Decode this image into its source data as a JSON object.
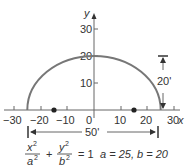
{
  "diagram": {
    "type": "semi-ellipse",
    "colors": {
      "curve": "#777777",
      "axis": "#666666",
      "text": "#333333",
      "focus": "#222222",
      "background": "#ffffff"
    },
    "axes": {
      "x_label": "x",
      "y_label": "y",
      "x_ticks": [
        "−30",
        "−20",
        "−10",
        "0",
        "10",
        "20",
        "30"
      ],
      "y_ticks": [
        "10",
        "20",
        "30"
      ]
    },
    "dimensions": {
      "width_label": "50'",
      "height_label": "20'"
    },
    "equation": {
      "x_num": "x",
      "x_den": "a",
      "y_num": "y",
      "y_den": "b",
      "exp": "2",
      "plus": "+",
      "equals": "= 1",
      "params": "a = 25, b = 20"
    },
    "foci": [
      -15,
      15
    ]
  }
}
